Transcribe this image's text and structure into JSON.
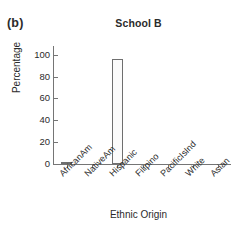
{
  "figure": {
    "panel_label": "(b)",
    "top_clipped_fragments": [
      "·",
      "·",
      "·"
    ]
  },
  "chart_data": {
    "type": "bar",
    "title": "School B",
    "xlabel": "Ethnic Origin",
    "ylabel": "Percentage",
    "categories": [
      "AfricanAm",
      "NativeAm",
      "Hispanic",
      "Filipino",
      "PacificIsInd",
      "White",
      "Asian"
    ],
    "values": [
      1,
      0,
      96,
      0,
      0,
      0,
      0
    ],
    "ylim": [
      0,
      107
    ],
    "yticks": [
      0,
      20,
      40,
      60,
      80,
      100
    ],
    "ytick_labels": [
      "0",
      "20",
      "40",
      "60",
      "80",
      "100"
    ],
    "grid": false,
    "legend": null,
    "tick_direction": "in",
    "spines": [
      "left",
      "bottom"
    ],
    "bar_fill": "#fbfbfb",
    "bar_edge": "#6f6f6f",
    "axis_color": "#757575",
    "text_color": "#2b2b2b",
    "xtick_label_rotation": -45
  }
}
